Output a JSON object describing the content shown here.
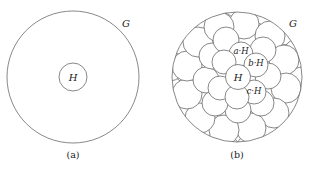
{
  "panels": [
    {
      "id": "a",
      "caption": "(a)",
      "group_label": "G",
      "subgroup_label": "H"
    },
    {
      "id": "b",
      "caption": "(b)",
      "group_label": "G",
      "subgroup_label": "H",
      "coset_labels": [
        "a·H",
        "b·H",
        "c·H"
      ]
    }
  ],
  "colors": {
    "stroke": "#6a6a6a",
    "text": "#222222",
    "background": "#ffffff"
  }
}
